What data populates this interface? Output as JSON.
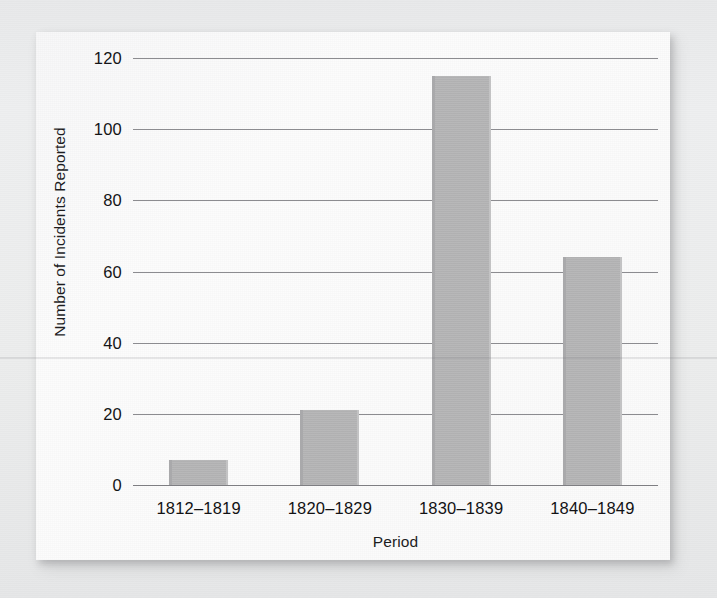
{
  "chart_data": {
    "type": "bar",
    "title": "",
    "subtitle": "",
    "xlabel": "Period",
    "ylabel": "Number of Incidents Reported",
    "categories": [
      "1812–1819",
      "1820–1829",
      "1830–1839",
      "1840–1849"
    ],
    "values": [
      7,
      21,
      115,
      64
    ],
    "series": [
      {
        "name": "Number of Incidents Reported",
        "values": [
          7,
          21,
          115,
          64
        ]
      }
    ],
    "ylim": [
      0,
      120
    ],
    "ytick_labels": [
      "120",
      "100",
      "80",
      "60",
      "40",
      "20",
      "0"
    ],
    "ytick_values": [
      120,
      100,
      80,
      60,
      40,
      20,
      0
    ],
    "ytick_step": 20,
    "grid": true,
    "grid_axis": "y",
    "legend": false,
    "legend_position": "none",
    "annotations": [],
    "bar_color": "#b4b4b5",
    "gridline_color": "#8c8c90",
    "plot_background": "#fbfbfb",
    "page_background": "#ecedee",
    "text_color": "#141416"
  }
}
